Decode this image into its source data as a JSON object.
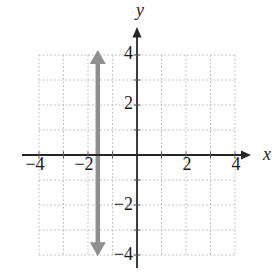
{
  "figure": {
    "background": "#ffffff"
  },
  "chart_data": {
    "type": "line",
    "title": "",
    "xlabel": "x",
    "ylabel": "y",
    "xlim": [
      -4,
      4
    ],
    "ylim": [
      -4,
      4
    ],
    "grid": {
      "visible": true,
      "style": "dotted",
      "spacing": 1,
      "color": "#b7b7b7"
    },
    "axes": {
      "color": "#262626",
      "tick_color": "#5a5a5a",
      "arrow_on_positive_ends": true
    },
    "x_tick_labels": [
      {
        "value": -4,
        "label": "−4"
      },
      {
        "value": -2,
        "label": "−2"
      },
      {
        "value": 2,
        "label": "2"
      },
      {
        "value": 4,
        "label": "4"
      }
    ],
    "y_tick_labels": [
      {
        "value": 4,
        "label": "4"
      },
      {
        "value": 2,
        "label": "2"
      },
      {
        "value": -2,
        "label": "−2"
      },
      {
        "value": -4,
        "label": "−4"
      }
    ],
    "series": [
      {
        "name": "vertical-line",
        "shape": "vertical-line",
        "x": -1.6,
        "y_span_drawn": [
          -4.05,
          4.2
        ],
        "color": "#8f8f8f",
        "stroke_width": 4.5,
        "arrows": "both"
      }
    ]
  }
}
